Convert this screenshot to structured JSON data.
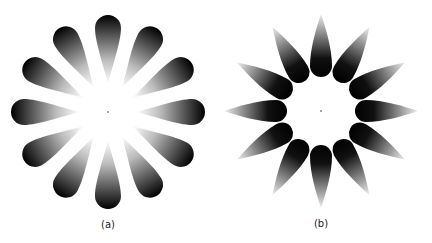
{
  "figures": [
    {
      "id": "a",
      "label": "(a)",
      "petals": 12,
      "style": "dark outer rounded end, fading to light pointed inner end"
    },
    {
      "id": "b",
      "label": "(b)",
      "petals": 12,
      "style": "dark inner rounded end, fading to light pointed outer tip"
    }
  ],
  "colors": {
    "petal_dark": "#000000",
    "petal_light": "#ffffff",
    "background": "#ffffff"
  }
}
